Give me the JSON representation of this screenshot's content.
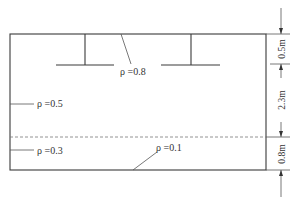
{
  "diagram": {
    "type": "soil-profile-cross-section",
    "labels": {
      "rho_top": "ρ =0.8",
      "rho_upper": "ρ =0.5",
      "rho_lower": "ρ =0.3",
      "rho_bottom": "ρ =0.1"
    },
    "dimensions": {
      "d1": "0.5m",
      "d2": "2.3m",
      "d3": "0.8m"
    },
    "elements": {
      "footings": [
        "left-footing",
        "right-footing"
      ],
      "layer_boundary": "dashed"
    }
  }
}
